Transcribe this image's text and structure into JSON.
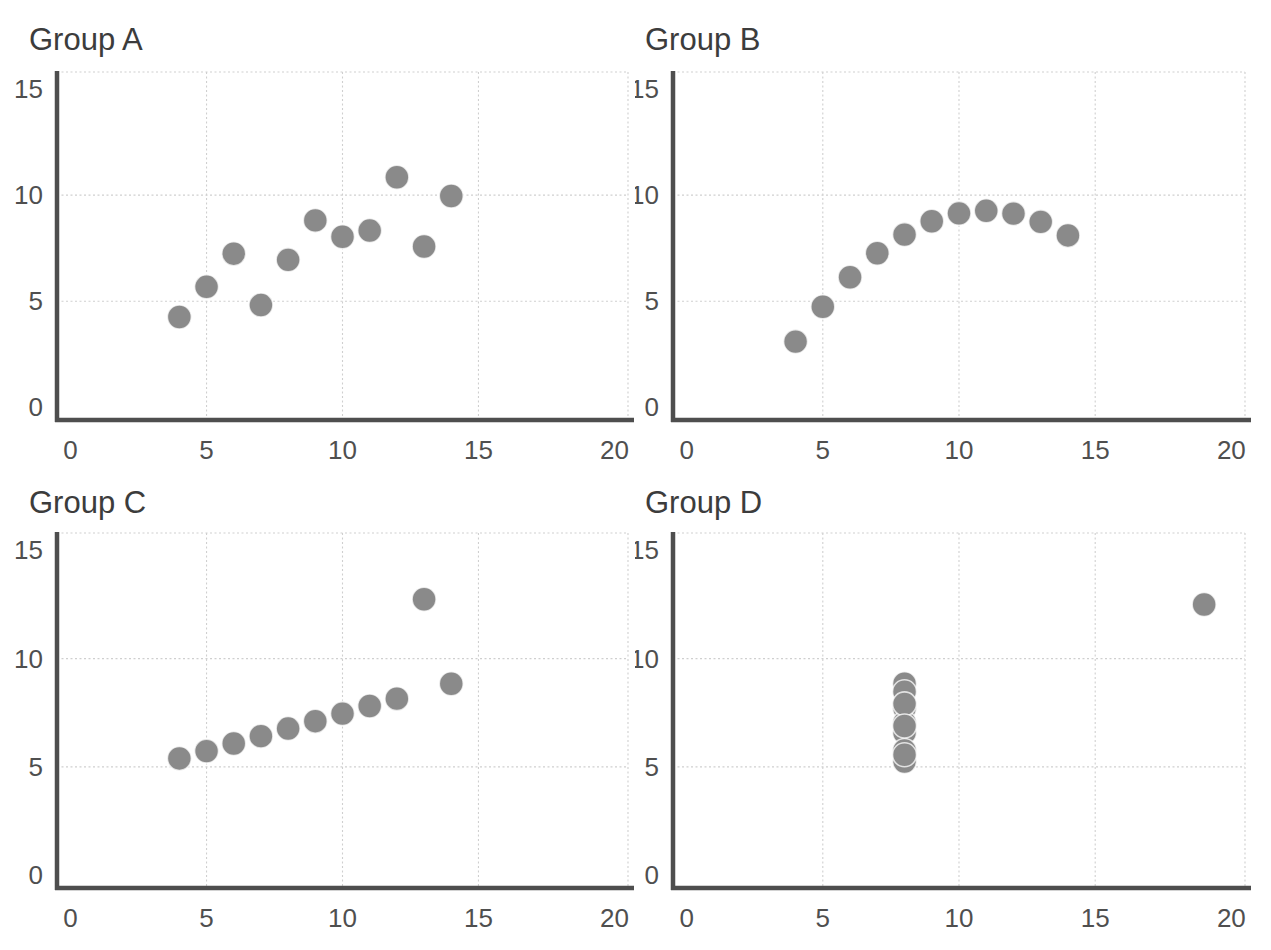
{
  "figure": {
    "background": "#ffffff"
  },
  "style": {
    "title_color": "#3c3c3c",
    "tick_color": "#4f4f4f",
    "axis_color": "#4e4e4e",
    "grid_color": "#cfcfcf",
    "border_color": "#cfcfcf",
    "point_color": "#8a8a8a",
    "point_edge_color": "#ffffff",
    "marker_radius": 12
  },
  "chart_data": [
    {
      "type": "scatter",
      "title": "Group A",
      "x": [
        10,
        8,
        13,
        9,
        11,
        14,
        6,
        4,
        12,
        7,
        5
      ],
      "y": [
        8.04,
        6.95,
        7.58,
        8.81,
        8.33,
        9.96,
        7.24,
        4.26,
        10.84,
        4.82,
        5.68
      ],
      "xlabel": "",
      "ylabel": "",
      "xlim": [
        -0.5,
        20.5
      ],
      "ylim": [
        -0.5,
        15.8
      ],
      "xticks": [
        0,
        5,
        10,
        15,
        20
      ],
      "yticks": [
        0,
        5,
        10,
        15
      ],
      "grid": true,
      "legend": "none"
    },
    {
      "type": "scatter",
      "title": "Group B",
      "x": [
        10,
        8,
        13,
        9,
        11,
        14,
        6,
        4,
        12,
        7,
        5
      ],
      "y": [
        9.14,
        8.14,
        8.74,
        8.77,
        9.26,
        8.1,
        6.13,
        3.1,
        9.13,
        7.26,
        4.74
      ],
      "xlabel": "",
      "ylabel": "",
      "xlim": [
        -0.5,
        20.5
      ],
      "ylim": [
        -0.5,
        15.8
      ],
      "xticks": [
        0,
        5,
        10,
        15,
        20
      ],
      "yticks": [
        0,
        5,
        10,
        15
      ],
      "grid": true,
      "legend": "none"
    },
    {
      "type": "scatter",
      "title": "Group C",
      "x": [
        10,
        8,
        13,
        9,
        11,
        14,
        6,
        4,
        12,
        7,
        5
      ],
      "y": [
        7.46,
        6.77,
        12.74,
        7.11,
        7.81,
        8.84,
        6.08,
        5.39,
        8.15,
        6.42,
        5.73
      ],
      "xlabel": "",
      "ylabel": "",
      "xlim": [
        -0.5,
        20.5
      ],
      "ylim": [
        -0.5,
        15.8
      ],
      "xticks": [
        0,
        5,
        10,
        15,
        20
      ],
      "yticks": [
        0,
        5,
        10,
        15
      ],
      "grid": true,
      "legend": "none"
    },
    {
      "type": "scatter",
      "title": "Group D",
      "x": [
        8,
        8,
        8,
        8,
        8,
        8,
        8,
        19,
        8,
        8,
        8
      ],
      "y": [
        6.58,
        5.76,
        7.71,
        8.84,
        8.47,
        7.04,
        5.25,
        12.5,
        5.56,
        7.91,
        6.89
      ],
      "xlabel": "",
      "ylabel": "",
      "xlim": [
        -0.5,
        20.5
      ],
      "ylim": [
        -0.5,
        15.8
      ],
      "xticks": [
        0,
        5,
        10,
        15,
        20
      ],
      "yticks": [
        0,
        5,
        10,
        15
      ],
      "grid": true,
      "legend": "none"
    }
  ]
}
